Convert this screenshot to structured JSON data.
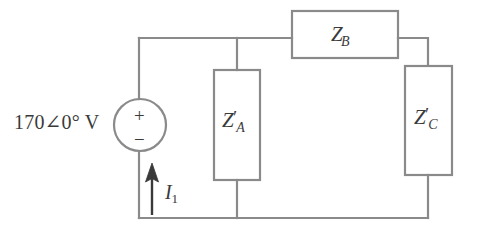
{
  "figure": {
    "type": "electrical-circuit-schematic",
    "width": 477,
    "height": 235,
    "background_color": "#ffffff",
    "line_color": "#8a8a8a",
    "text_color": "#3a3a3a"
  },
  "source": {
    "name": "independent-voltage-source",
    "label": "170∠0° V",
    "magnitude": "170",
    "angle": "0°",
    "unit": "V",
    "plus_sign": "+",
    "minus_sign": "−",
    "shape": "circle",
    "center_x": 140,
    "center_y": 125,
    "radius": 26
  },
  "current": {
    "name": "branch-current",
    "symbol": "I",
    "subscript": "1",
    "label": "I₁",
    "direction": "up"
  },
  "impedances": [
    {
      "id": "za",
      "symbol": "Z",
      "prime": "′",
      "subscript": "A",
      "label": "Z′A",
      "orientation": "vertical",
      "box": {
        "x": 214,
        "y": 70,
        "w": 46,
        "h": 110
      }
    },
    {
      "id": "zb",
      "symbol": "Z",
      "prime": "",
      "subscript": "B",
      "label": "ZB",
      "orientation": "horizontal",
      "box": {
        "x": 292,
        "y": 11,
        "w": 106,
        "h": 47
      }
    },
    {
      "id": "zc",
      "symbol": "Z",
      "prime": "′",
      "subscript": "C",
      "label": "Z′C",
      "orientation": "vertical",
      "box": {
        "x": 405,
        "y": 66,
        "w": 47,
        "h": 109
      }
    }
  ],
  "wires": {
    "top_rail_y": 38,
    "bottom_rail_y": 218,
    "left_rail_x": 139,
    "za_branch_x": 237,
    "zc_branch_x": 428,
    "zb_left_x": 292,
    "zb_right_x": 398
  }
}
